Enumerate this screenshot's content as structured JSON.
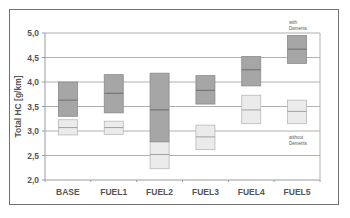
{
  "chart_data": {
    "type": "box",
    "title": "",
    "xlabel": "",
    "ylabel": "Total HC [g/km]",
    "ylim": [
      2.0,
      5.0
    ],
    "yticks": [
      "2,0",
      "2,5",
      "3,0",
      "3,5",
      "4,0",
      "4,5",
      "5,0"
    ],
    "categories": [
      "BASE",
      "FUEL1",
      "FUEL2",
      "FUEL3",
      "FUEL4",
      "FUEL5"
    ],
    "grid": true,
    "series": [
      {
        "name": "with Demerits",
        "color": "#a6a6a6",
        "low": [
          3.3,
          3.37,
          2.78,
          3.55,
          3.92,
          4.38
        ],
        "median": [
          3.63,
          3.77,
          3.43,
          3.83,
          4.25,
          4.67
        ],
        "high": [
          4.0,
          4.15,
          4.18,
          4.13,
          4.52,
          4.95
        ]
      },
      {
        "name": "without Demerits",
        "color": "#ebebeb",
        "low": [
          2.92,
          2.93,
          2.23,
          2.62,
          3.15,
          3.15
        ],
        "median": [
          3.07,
          3.07,
          2.52,
          2.88,
          3.43,
          3.4
        ],
        "high": [
          3.23,
          3.2,
          2.78,
          3.12,
          3.73,
          3.63
        ]
      }
    ],
    "annotations": [
      {
        "text_lines": [
          "with",
          "Demerits"
        ],
        "near": "FUEL5",
        "position": "above"
      },
      {
        "text_lines": [
          "without",
          "Demerits"
        ],
        "near": "FUEL5",
        "position": "below"
      }
    ]
  }
}
